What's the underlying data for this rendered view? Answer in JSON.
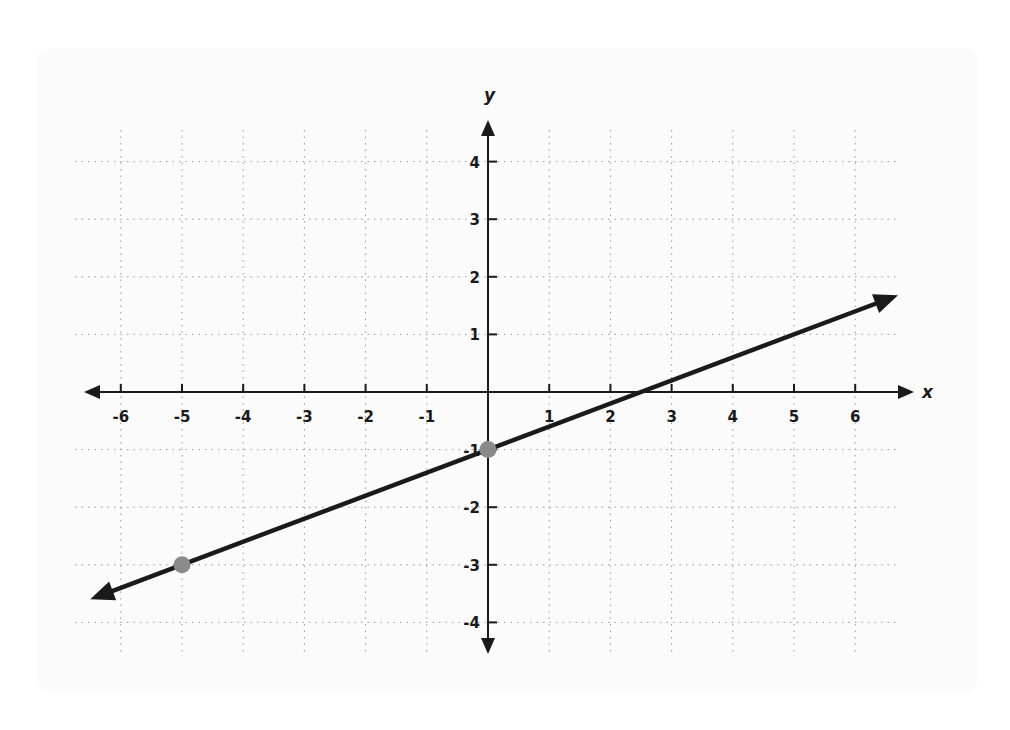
{
  "chart_data": {
    "type": "line",
    "title": "",
    "xlabel": "x",
    "ylabel": "y",
    "xlim": [
      -6.5,
      6.5
    ],
    "ylim": [
      -4.5,
      4.5
    ],
    "grid": true,
    "grid_style": "dotted",
    "x_ticks": [
      -6,
      -5,
      -4,
      -3,
      -2,
      -1,
      1,
      2,
      3,
      4,
      5,
      6
    ],
    "y_ticks": [
      -4,
      -3,
      -2,
      -1,
      1,
      2,
      3,
      4
    ],
    "x_tick_labels": [
      "-6",
      "-5",
      "-4",
      "-3",
      "-2",
      "-1",
      "1",
      "2",
      "3",
      "4",
      "5",
      "6"
    ],
    "y_tick_labels": [
      "-4",
      "-3",
      "-2",
      "-1",
      "1",
      "2",
      "3",
      "4"
    ],
    "series": [
      {
        "name": "line",
        "equation": "y = (2/5)x - 1",
        "slope": 0.4,
        "intercept": -1,
        "x": [
          -6.5,
          6.7
        ],
        "y": [
          -3.6,
          1.68
        ],
        "arrows_both_ends": true,
        "color": "#1a1a1a"
      }
    ],
    "marked_points": [
      {
        "x": -5,
        "y": -3,
        "color": "#8a8a8a"
      },
      {
        "x": 0,
        "y": -1,
        "color": "#8a8a8a"
      }
    ]
  },
  "labels": {
    "x_axis": "x",
    "y_axis": "y"
  },
  "colors": {
    "axis": "#1a1a1a",
    "grid": "#9a9a9a",
    "line": "#1a1a1a",
    "point": "#8a8a8a",
    "card_bg": "#fbfbfb"
  }
}
